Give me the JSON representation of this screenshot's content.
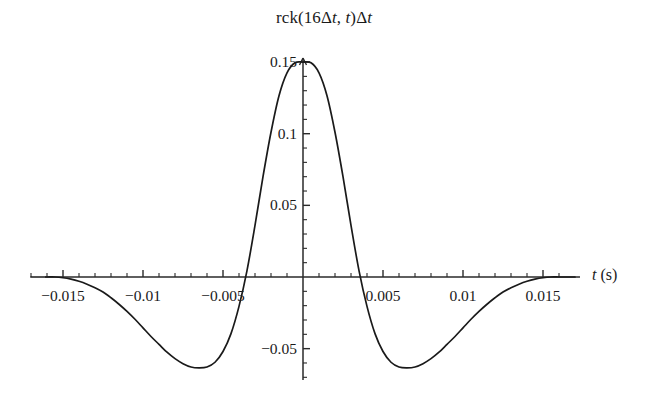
{
  "figure": {
    "title_prefix": "rck(16",
    "title_delta1": "Δ",
    "title_var1": "t",
    "title_mid": ", ",
    "title_var2": "t",
    "title_suffix": ")",
    "title_delta2": "Δ",
    "title_var3": "t",
    "title_plain": "rck(16Δt, t)Δt",
    "xaxis_label_var": "t",
    "xaxis_label_unit": "(s)",
    "line_color": "#1a1a1a",
    "axis_color": "#2a2a2a",
    "background_color": "#ffffff"
  },
  "chart_data": {
    "type": "line",
    "title": "rck(16Δt, t)Δt",
    "xlabel": "t (s)",
    "ylabel": "",
    "grid": false,
    "legend": null,
    "xlim": [
      -0.0175,
      0.0168
    ],
    "ylim": [
      -0.072,
      0.158
    ],
    "xticks": [
      -0.015,
      -0.01,
      -0.005,
      0.005,
      0.01,
      0.015
    ],
    "xtick_labels": [
      "−0.015",
      "−0.01",
      "−0.005",
      "0.005",
      "0.01",
      "0.015"
    ],
    "xminor_tick_step": 0.001,
    "yticks": [
      -0.05,
      0.05,
      0.1,
      0.15
    ],
    "ytick_labels": [
      "−0.05",
      "0.05",
      "0.1",
      "0.15"
    ],
    "yminor_tick_step": 0.01,
    "peak": {
      "x": 0,
      "y": 0.15
    },
    "minima": [
      {
        "x": -0.0062,
        "y": -0.063
      },
      {
        "x": 0.0062,
        "y": -0.063
      }
    ],
    "zero_crossings": [
      -0.0043,
      0.0043,
      -0.0132,
      0.0132
    ],
    "x": [
      -0.017,
      -0.0165,
      -0.016,
      -0.0155,
      -0.015,
      -0.0145,
      -0.014,
      -0.0135,
      -0.013,
      -0.0125,
      -0.012,
      -0.0115,
      -0.011,
      -0.0105,
      -0.01,
      -0.0095,
      -0.009,
      -0.0085,
      -0.008,
      -0.0075,
      -0.007,
      -0.0065,
      -0.006,
      -0.0055,
      -0.005,
      -0.0045,
      -0.004,
      -0.0035,
      -0.003,
      -0.0025,
      -0.002,
      -0.0015,
      -0.001,
      -0.0005,
      0.0,
      0.0005,
      0.001,
      0.0015,
      0.002,
      0.0025,
      0.003,
      0.0035,
      0.004,
      0.0045,
      0.005,
      0.0055,
      0.006,
      0.0065,
      0.007,
      0.0075,
      0.008,
      0.0085,
      0.009,
      0.0095,
      0.01,
      0.0105,
      0.011,
      0.0115,
      0.012,
      0.0125,
      0.013,
      0.0135,
      0.014,
      0.0145,
      0.015,
      0.0155,
      0.016,
      0.0165,
      0.017
    ],
    "y": [
      0.0,
      0.0,
      0.0,
      0.0,
      -0.0005,
      -0.0015,
      -0.003,
      -0.005,
      -0.0075,
      -0.0105,
      -0.0145,
      -0.019,
      -0.024,
      -0.0295,
      -0.0355,
      -0.0415,
      -0.047,
      -0.0525,
      -0.057,
      -0.0605,
      -0.0628,
      -0.0634,
      -0.0628,
      -0.0595,
      -0.052,
      -0.0395,
      -0.0205,
      0.0045,
      0.036,
      0.07,
      0.101,
      0.1265,
      0.1425,
      0.1495,
      0.15,
      0.1495,
      0.1425,
      0.1265,
      0.101,
      0.07,
      0.036,
      0.0045,
      -0.0205,
      -0.0395,
      -0.052,
      -0.0595,
      -0.0628,
      -0.0634,
      -0.0628,
      -0.0605,
      -0.057,
      -0.0525,
      -0.047,
      -0.0415,
      -0.0355,
      -0.0295,
      -0.024,
      -0.019,
      -0.0145,
      -0.0105,
      -0.0075,
      -0.005,
      -0.003,
      -0.0015,
      -0.0005,
      0.0,
      0.0,
      0.0,
      0.0
    ]
  },
  "geometry": {
    "origin_px": {
      "x": 303,
      "y": 277
    },
    "px_per_x_unit": 16000,
    "px_per_y_unit": 1433,
    "x_axis_start_px": 45,
    "x_axis_end_px": 580,
    "y_axis_top_px": 58,
    "y_axis_bottom_px": 380
  }
}
